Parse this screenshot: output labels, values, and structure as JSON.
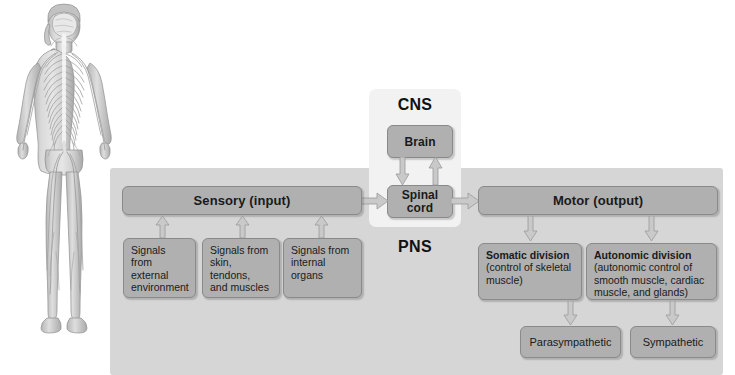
{
  "diagram": {
    "regions": {
      "cns_label": "CNS",
      "pns_label": "PNS"
    },
    "colors": {
      "panel_pns": "#d6d6d6",
      "panel_cns": "#f2f2f2",
      "box_fill": "#b0b0b0",
      "box_border": "#8a8a8a",
      "arrow_fill": "#c9c9c9",
      "arrow_border": "#9a9a9a",
      "page_background": "#ffffff"
    },
    "illustration": {
      "name": "human-nervous-system-figure",
      "description": "Grayscale anatomical illustration of a standing human body showing the brain, spinal cord and peripheral nerves"
    },
    "cns": {
      "brain": "Brain",
      "spinal_cord": "Spinal\ncord",
      "spinal_cord_line1": "Spinal",
      "spinal_cord_line2": "cord"
    },
    "sensory": {
      "header": "Sensory (input)",
      "sources": [
        {
          "line1": "Signals",
          "line2": "from external",
          "line3": "environment"
        },
        {
          "line1": "Signals from",
          "line2": "skin, tendons,",
          "line3": "and muscles"
        },
        {
          "line1": "Signals from",
          "line2": "internal organs",
          "line3": ""
        }
      ]
    },
    "motor": {
      "header": "Motor (output)",
      "divisions": [
        {
          "title": "Somatic division",
          "detail_line1": "(control of skeletal",
          "detail_line2": "muscle)",
          "detail_line3": "",
          "detail_line4": ""
        },
        {
          "title": "Autonomic division",
          "detail_line1": "(autonomic control of",
          "detail_line2": "smooth muscle, cardiac",
          "detail_line3": "muscle, and glands)",
          "detail_line4": ""
        }
      ],
      "autonomic_branches": [
        {
          "label": "Parasympathetic"
        },
        {
          "label": "Sympathetic"
        }
      ]
    },
    "arrows": [
      {
        "name": "brain-to-spinal-cord",
        "direction": "down"
      },
      {
        "name": "spinal-cord-to-brain",
        "direction": "up"
      },
      {
        "name": "sensory-to-spinal-cord",
        "direction": "right"
      },
      {
        "name": "spinal-cord-to-motor",
        "direction": "right"
      },
      {
        "name": "external-signals-to-sensory",
        "direction": "up"
      },
      {
        "name": "skin-signals-to-sensory",
        "direction": "up"
      },
      {
        "name": "internal-signals-to-sensory",
        "direction": "up"
      },
      {
        "name": "motor-to-somatic",
        "direction": "down"
      },
      {
        "name": "motor-to-autonomic",
        "direction": "down"
      },
      {
        "name": "autonomic-to-parasympathetic",
        "direction": "down"
      },
      {
        "name": "autonomic-to-sympathetic",
        "direction": "down"
      }
    ]
  }
}
